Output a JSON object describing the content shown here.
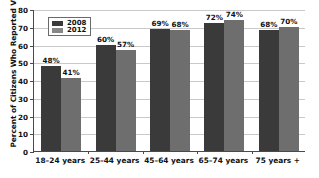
{
  "chart_data": {
    "type": "bar",
    "title": "",
    "xlabel": "",
    "ylabel": "Percent of Citizens Who Reported Voting",
    "ylim": [
      0,
      80
    ],
    "yticks": [
      0,
      10,
      20,
      30,
      40,
      50,
      60,
      70,
      80
    ],
    "ytick_labels": [
      "0",
      "10",
      "20",
      "30",
      "40",
      "50",
      "60",
      "70",
      "80"
    ],
    "grid": true,
    "legend_position": "upper-left",
    "categories": [
      "18–24 years",
      "25–44 years",
      "45–64 years",
      "65–74 years",
      "75 years +"
    ],
    "series": [
      {
        "name": "2008",
        "color": "#3a3a3a",
        "values": [
          48,
          60,
          69,
          72,
          68
        ],
        "labels": [
          "48%",
          "60%",
          "69%",
          "72%",
          "68%"
        ]
      },
      {
        "name": "2012",
        "color": "#6e6e6e",
        "values": [
          41,
          57,
          68,
          74,
          70
        ],
        "labels": [
          "41%",
          "57%",
          "68%",
          "74%",
          "70%"
        ]
      }
    ]
  }
}
